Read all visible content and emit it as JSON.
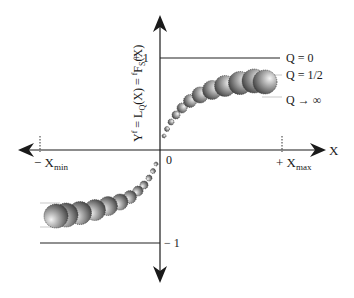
{
  "diagram": {
    "y_axis_label": {
      "main": "Y",
      "sup": "f",
      "eq1": " = L",
      "sub1": "Q",
      "eq2": "(X) = ",
      "sup2": "f",
      "F": "F",
      "sub2": "S",
      "end": "(X)"
    },
    "x_axis_label": "X",
    "origin_label": "0",
    "y_plus_one": "+ 1",
    "y_minus_one": "− 1",
    "x_min_label": {
      "prefix": "− X",
      "sub": "min"
    },
    "x_max_label": {
      "prefix": "+ X",
      "sub": "max"
    },
    "curves": [
      {
        "label": "Q = 0"
      },
      {
        "label": "Q = 1/2"
      },
      {
        "label": "Q → ∞"
      }
    ],
    "colors": {
      "axis": "#1a1a1a",
      "line": "#222222",
      "guide": "#bbbbbb"
    }
  }
}
